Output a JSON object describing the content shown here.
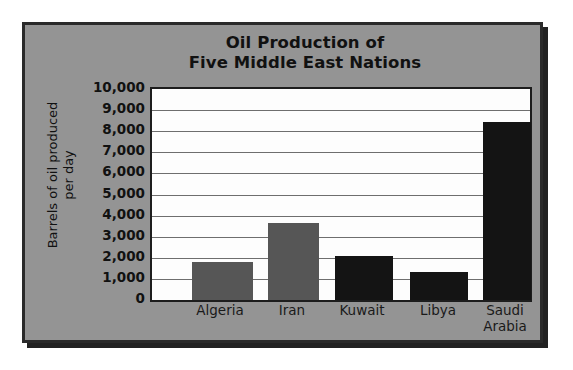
{
  "chart_data": {
    "type": "bar",
    "title": "Oil Production of Five Middle East Nations",
    "title_lines": [
      "Oil Production of",
      "Five Middle East Nations"
    ],
    "xlabel": "",
    "ylabel": "Barrels of oil produced per day",
    "ylabel_lines": [
      "Barrels of oil produced",
      "per day"
    ],
    "categories": [
      "Algeria",
      "Iran",
      "Kuwait",
      "Libya",
      "Saudi Arabia"
    ],
    "category_lines": [
      [
        "Algeria"
      ],
      [
        "Iran"
      ],
      [
        "Kuwait"
      ],
      [
        "Libya"
      ],
      [
        "Saudi",
        "Arabia"
      ]
    ],
    "values": [
      1800,
      3650,
      2100,
      1350,
      8450
    ],
    "ylim": [
      0,
      10000
    ],
    "ytick_values": [
      10000,
      9000,
      8000,
      7000,
      6000,
      5000,
      4000,
      3000,
      2000,
      1000,
      0
    ],
    "ytick_labels": [
      "10,000",
      "9,000",
      "8,000",
      "7,000",
      "6,000",
      "5,000",
      "4,000",
      "3,000",
      "2,000",
      "1,000",
      "0"
    ],
    "grid": true,
    "legend": "none",
    "bar_colors": [
      "#565656",
      "#565656",
      "#141414",
      "#141414",
      "#141414"
    ],
    "bar_positions_px": [
      {
        "left": 40,
        "width": 61
      },
      {
        "left": 116,
        "width": 51
      },
      {
        "left": 183,
        "width": 58
      },
      {
        "left": 258,
        "width": 58
      },
      {
        "left": 331,
        "width": 48
      }
    ],
    "label_positions_px": [
      {
        "left": 20,
        "width": 100
      },
      {
        "left": 92,
        "width": 100
      },
      {
        "left": 162,
        "width": 100
      },
      {
        "left": 238,
        "width": 100
      },
      {
        "left": 305,
        "width": 100
      }
    ]
  },
  "colors": {
    "panel_background": "#949494",
    "panel_border": "#2a2a2a",
    "plot_background": "#fdfdfd",
    "plot_border": "#1d1d1d",
    "gridline": "#6e6e6e",
    "text": "#111111",
    "bar_gray": "#565656",
    "bar_black": "#141414"
  }
}
